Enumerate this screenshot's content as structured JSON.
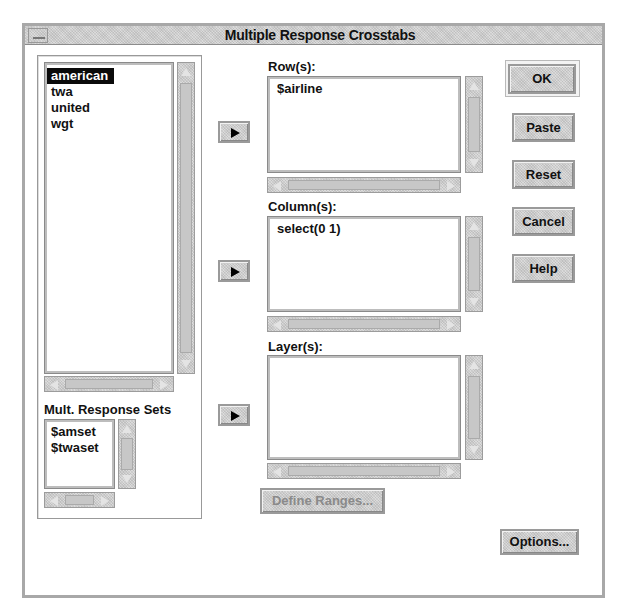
{
  "window": {
    "title": "Multiple Response Crosstabs",
    "menu_icon": "window-menu-icon"
  },
  "variables": {
    "items": [
      "american",
      "twa",
      "united",
      "wgt"
    ],
    "selected_index": 0
  },
  "mult_response_sets": {
    "label": "Mult. Response Sets",
    "items": [
      "$amset",
      "$twaset"
    ]
  },
  "rows": {
    "label": "Row(s):",
    "items": [
      "$airline"
    ]
  },
  "columns": {
    "label": "Column(s):",
    "items": [
      "select(0 1)"
    ]
  },
  "layers": {
    "label": "Layer(s):",
    "items": []
  },
  "transfer_buttons": {
    "icon": "right-arrow-icon"
  },
  "buttons": {
    "ok": "OK",
    "paste": "Paste",
    "reset": "Reset",
    "cancel": "Cancel",
    "help": "Help",
    "define_ranges": "Define Ranges...",
    "options": "Options..."
  }
}
